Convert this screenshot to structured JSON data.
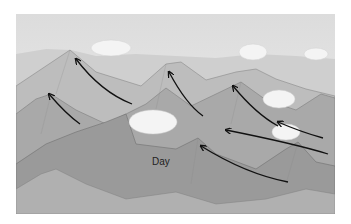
{
  "illustration": {
    "subject": "Mountain range with upslope valley breeze arrows",
    "label": "Day",
    "arrow_count": 7,
    "cloud_count": 6
  }
}
